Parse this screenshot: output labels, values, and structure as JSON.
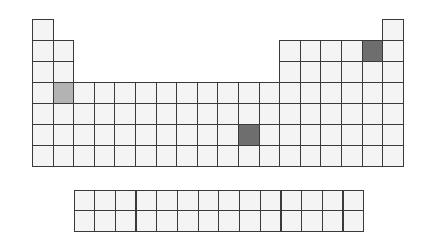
{
  "diagram": {
    "type": "periodic-table-outline",
    "main_table": {
      "periods": 7,
      "groups": 18,
      "origin": {
        "x": 32,
        "y": 18.5
      },
      "cell_w": 20.6,
      "cell_h": 21.1
    },
    "f_block": {
      "rows": 2,
      "cols": 14,
      "origin": {
        "x": 73.5,
        "y": 189.5
      },
      "cell_w": 20.7,
      "cell_h": 20.8
    },
    "highlighted_cells": [
      {
        "period": 4,
        "group": 2,
        "shade": "light"
      },
      {
        "period": 2,
        "group": 17,
        "shade": "dark"
      },
      {
        "period": 6,
        "group": 11,
        "shade": "dark"
      }
    ],
    "colors": {
      "cell_fill": "#f4f4f4",
      "cell_border": "#3a3a3a",
      "highlight_light": "#b3b3b3",
      "highlight_dark": "#6e6e6e",
      "background": "#ffffff"
    }
  }
}
